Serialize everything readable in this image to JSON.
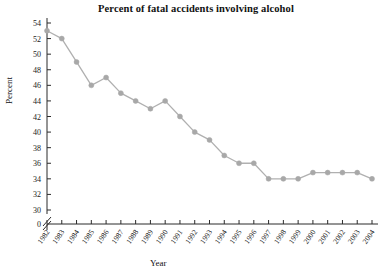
{
  "chart_data": {
    "type": "line",
    "title": "Percent of fatal accidents involving alcohol",
    "xlabel": "Year",
    "ylabel": "Percent",
    "grid": false,
    "legend": false,
    "axis_break": true,
    "origin_label": "0",
    "xlim": [
      1982,
      2004
    ],
    "ylim": [
      30,
      54
    ],
    "ytick_step": 2,
    "marker": "circle",
    "marker_color": "#a8a8a8",
    "line_color": "#b0b0b0",
    "x": [
      1982,
      1983,
      1984,
      1985,
      1986,
      1987,
      1988,
      1989,
      1990,
      1991,
      1992,
      1993,
      1994,
      1995,
      1996,
      1997,
      1998,
      1999,
      2000,
      2001,
      2002,
      2003,
      2004
    ],
    "categories": [
      "1982",
      "1983",
      "1984",
      "1985",
      "1986",
      "1987",
      "1988",
      "1989",
      "1990",
      "1991",
      "1992",
      "1993",
      "1994",
      "1995",
      "1996",
      "1997",
      "1998",
      "1999",
      "2000",
      "2001",
      "2002",
      "2003",
      "2004"
    ],
    "values": [
      53,
      52,
      49,
      46,
      47,
      45,
      44,
      43,
      44,
      42,
      40,
      39,
      37,
      36,
      36,
      34,
      34,
      34,
      34.8,
      34.8,
      34.8,
      34.8,
      34
    ],
    "ytick_labels": [
      "30",
      "32",
      "34",
      "36",
      "38",
      "40",
      "42",
      "44",
      "46",
      "48",
      "50",
      "52",
      "54"
    ],
    "ytick_values": [
      30,
      32,
      34,
      36,
      38,
      40,
      42,
      44,
      46,
      48,
      50,
      52,
      54
    ]
  }
}
